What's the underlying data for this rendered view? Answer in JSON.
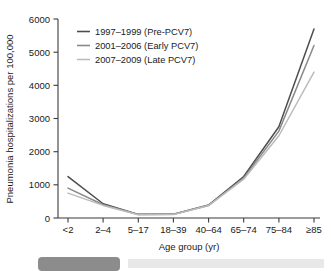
{
  "chart_data": {
    "type": "line",
    "title": "",
    "xlabel": "Age group (yr)",
    "ylabel": "Pneumonia hospitalizations per 100,000",
    "categories": [
      "<2",
      "2–4",
      "5–17",
      "18–39",
      "40–64",
      "65–74",
      "75–84",
      "≥85"
    ],
    "yticks": [
      0,
      1000,
      2000,
      3000,
      4000,
      5000,
      6000
    ],
    "ylim": [
      0,
      6000
    ],
    "grid": false,
    "legend_position": "top-left",
    "series": [
      {
        "name": "1997–1999 (Pre-PCV7)",
        "color": "#4d4d4d",
        "values": [
          1250,
          430,
          110,
          110,
          390,
          1250,
          2750,
          5700
        ]
      },
      {
        "name": "2001–2006 (Early PCV7)",
        "color": "#8a8a8a",
        "values": [
          900,
          400,
          105,
          110,
          380,
          1200,
          2620,
          5200
        ]
      },
      {
        "name": "2007–2009 (Late PCV7)",
        "color": "#bcbcbc",
        "values": [
          750,
          380,
          100,
          105,
          375,
          1170,
          2480,
          4400
        ]
      }
    ]
  },
  "axes": {
    "y_title": "Pneumonia hospitalizations per 100,000",
    "x_title": "Age group (yr)",
    "y_tick_labels": [
      "0",
      "1000",
      "2000",
      "3000",
      "4000",
      "5000",
      "6000"
    ],
    "x_tick_labels": [
      "<2",
      "2–4",
      "5–17",
      "18–39",
      "40–64",
      "65–74",
      "75–84",
      "≥85"
    ]
  },
  "legend": {
    "items": [
      {
        "label": "1997–1999 (Pre-PCV7)",
        "color": "#4d4d4d"
      },
      {
        "label": "2001–2006 (Early PCV7)",
        "color": "#8a8a8a"
      },
      {
        "label": "2007–2009 (Late PCV7)",
        "color": "#bcbcbc"
      }
    ]
  },
  "caption": {
    "bar_color": "#8c8c8c"
  }
}
